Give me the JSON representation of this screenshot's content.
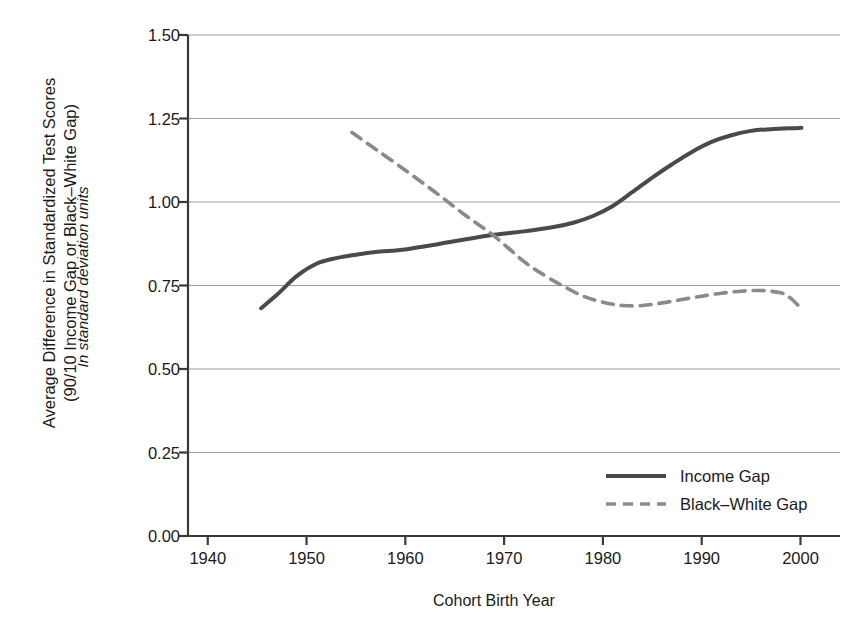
{
  "chart_data": {
    "type": "line",
    "title": "",
    "ylabel": "Average Difference in Standardized Test Scores\n(90/10 Income Gap or Black–White Gap)",
    "ylabel_secondary": "In standard deviation units",
    "xlabel": "Cohort Birth Year",
    "xlim": [
      1938,
      2004
    ],
    "ylim": [
      0.0,
      1.5
    ],
    "grid": true,
    "grid_axis": "y",
    "legend_position": "bottom-right",
    "xticks": [
      1940,
      1950,
      1960,
      1970,
      1980,
      1990,
      2000
    ],
    "xtick_labels": [
      "1940",
      "1950",
      "1960",
      "1970",
      "1980",
      "1990",
      "2000"
    ],
    "yticks": [
      0.0,
      0.25,
      0.5,
      0.75,
      1.0,
      1.25,
      1.5
    ],
    "ytick_labels": [
      "0.00",
      "0.25",
      "0.50",
      "0.75",
      "1.00",
      "1.25",
      "1.50"
    ],
    "series": [
      {
        "name": "Income Gap",
        "style": "solid",
        "color": "#4a4a4a",
        "width": 4.0,
        "x": [
          1945.4,
          1947,
          1949,
          1951,
          1953,
          1955,
          1957,
          1960,
          1963,
          1966,
          1969,
          1972,
          1975,
          1977,
          1979,
          1981,
          1983,
          1985,
          1987,
          1989,
          1991,
          1993,
          1995,
          1997,
          1999,
          2000.1
        ],
        "y": [
          0.682,
          0.722,
          0.778,
          0.815,
          0.832,
          0.842,
          0.85,
          0.858,
          0.872,
          0.888,
          0.902,
          0.912,
          0.925,
          0.938,
          0.958,
          0.988,
          1.03,
          1.073,
          1.113,
          1.15,
          1.18,
          1.2,
          1.213,
          1.218,
          1.221,
          1.222
        ]
      },
      {
        "name": "Black–White Gap",
        "style": "dashed",
        "color": "#8a8a8a",
        "width": 3.6,
        "x": [
          1954.6,
          1957,
          1960,
          1963,
          1966,
          1969,
          1972,
          1974,
          1976,
          1978,
          1980,
          1982,
          1984,
          1986,
          1988,
          1990,
          1992,
          1994,
          1996,
          1998,
          1999,
          2000.1
        ],
        "y": [
          1.208,
          1.158,
          1.095,
          1.03,
          0.962,
          0.898,
          0.822,
          0.782,
          0.748,
          0.718,
          0.7,
          0.69,
          0.69,
          0.698,
          0.708,
          0.718,
          0.727,
          0.733,
          0.735,
          0.728,
          0.712,
          0.68
        ]
      }
    ]
  },
  "legend": {
    "items": [
      {
        "label": "Income Gap"
      },
      {
        "label": "Black–White Gap"
      }
    ]
  }
}
